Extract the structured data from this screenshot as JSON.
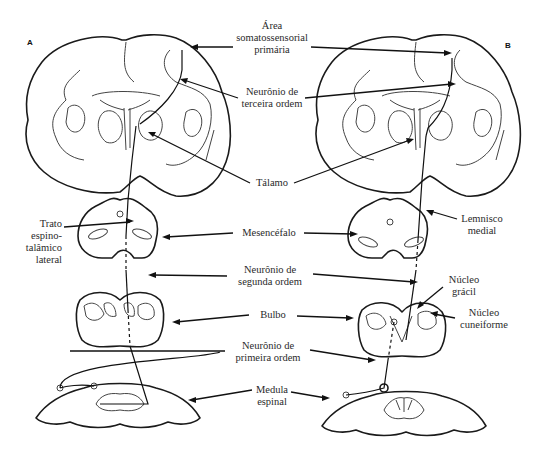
{
  "panels": {
    "left_letter": "A",
    "right_letter": "B"
  },
  "labels": {
    "area_somatossensorial": [
      "Área",
      "somatossensorial",
      "primária"
    ],
    "neuronio_terceira": [
      "Neurônio de",
      "terceira ordem"
    ],
    "talamo": "Tálamo",
    "trato_espinotalamico": [
      "Trato",
      "espino-",
      "talâmico",
      "lateral"
    ],
    "mesencefalo": "Mesencéfalo",
    "lemnisco_medial": [
      "Lemnisco",
      "medial"
    ],
    "neuronio_segunda": [
      "Neurônio de",
      "segunda ordem"
    ],
    "nucleo_gracil": [
      "Núcleo",
      "grácil"
    ],
    "bulbo": "Bulbo",
    "nucleo_cuneiforme": [
      "Núcleo",
      "cuneiforme"
    ],
    "neuronio_primeira": [
      "Neurônio de",
      "primeira ordem"
    ],
    "medula_espinal": [
      "Medula",
      "espinal"
    ]
  }
}
